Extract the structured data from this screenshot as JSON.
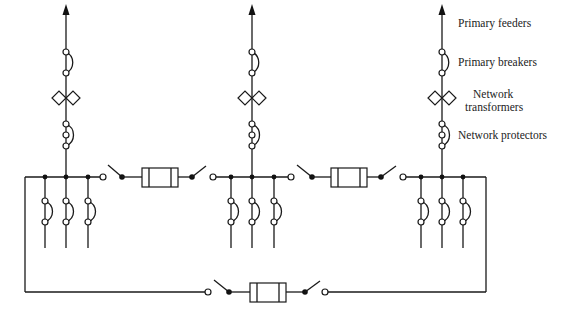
{
  "diagram": {
    "labels": {
      "primary_feeders": "Primary feeders",
      "primary_breakers": "Primary breakers",
      "network_transformers_line1": "Network",
      "network_transformers_line2": "transformers",
      "network_protectors": "Network protectors"
    },
    "networks": [
      {
        "id": "left",
        "x": 66,
        "branches": [
          45,
          66,
          88
        ]
      },
      {
        "id": "middle",
        "x": 252,
        "branches": [
          231,
          252,
          274
        ]
      },
      {
        "id": "right",
        "x": 442,
        "branches": [
          421,
          442,
          463
        ]
      }
    ],
    "ties": [
      {
        "id": "tie-left-middle",
        "between": [
          "left",
          "middle"
        ]
      },
      {
        "id": "tie-middle-right",
        "between": [
          "middle",
          "right"
        ]
      },
      {
        "id": "tie-bottom",
        "between": [
          "left",
          "right"
        ]
      }
    ],
    "colors": {
      "line": "#1a1a1a",
      "background": "#ffffff"
    }
  }
}
